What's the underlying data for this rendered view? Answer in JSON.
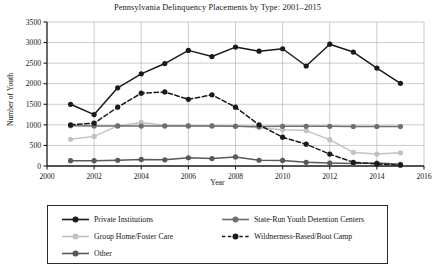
{
  "chart_data": {
    "type": "line",
    "title": "Pennsylvania Delinquency Placements by Type: 2001–2015",
    "xlabel": "Year",
    "ylabel": "Number of Youth",
    "grid": true,
    "legend_position": "bottom",
    "x": [
      2001,
      2002,
      2003,
      2004,
      2005,
      2006,
      2007,
      2008,
      2009,
      2010,
      2011,
      2012,
      2013,
      2014,
      2015
    ],
    "xlim": [
      2000,
      2016
    ],
    "ylim": [
      0,
      3500
    ],
    "xticks": [
      2000,
      2002,
      2004,
      2006,
      2008,
      2010,
      2012,
      2014,
      2016
    ],
    "yticks": [
      0,
      500,
      1000,
      1500,
      2000,
      2500,
      3000,
      3500
    ],
    "series": [
      {
        "name": "Private Institutions",
        "color": "#1a1a1a",
        "style": "solid",
        "values": [
          1500,
          1250,
          1900,
          2240,
          2490,
          2810,
          2660,
          2890,
          2790,
          2850,
          2430,
          2960,
          2770,
          2380,
          2010
        ]
      },
      {
        "name": "State-Run Youth Detention Centers",
        "color": "#6e6e6e",
        "style": "solid",
        "values": [
          980,
          975,
          975,
          970,
          970,
          975,
          975,
          965,
          960,
          965,
          965,
          965,
          960,
          960,
          960
        ]
      },
      {
        "name": "Group Home/Foster Care",
        "color": "#c2c2c2",
        "style": "solid",
        "values": [
          650,
          720,
          975,
          1060,
          990,
          975,
          975,
          975,
          930,
          880,
          860,
          640,
          330,
          290,
          320
        ]
      },
      {
        "name": "Wildnerness-Based/Boot Camp",
        "color": "#1a1a1a",
        "style": "dashed",
        "values": [
          1000,
          1040,
          1430,
          1770,
          1800,
          1620,
          1730,
          1430,
          1000,
          700,
          530,
          290,
          90,
          50,
          20
        ]
      },
      {
        "name": "Other",
        "color": "#595959",
        "style": "solid",
        "values": [
          130,
          130,
          140,
          160,
          150,
          200,
          180,
          220,
          140,
          135,
          90,
          70,
          60,
          70,
          40
        ]
      }
    ]
  },
  "legend": {
    "items": [
      {
        "label": "Private Institutions"
      },
      {
        "label": "State-Run Youth Detention Centers"
      },
      {
        "label": "Group Home/Foster Care"
      },
      {
        "label": "Wildnerness-Based/Boot Camp"
      },
      {
        "label": "Other"
      }
    ]
  }
}
